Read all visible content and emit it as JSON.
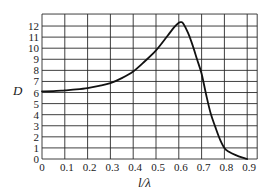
{
  "chart_data": {
    "type": "line",
    "title": "",
    "xlabel": "l/λ",
    "ylabel": "D",
    "xlim": [
      0,
      0.9
    ],
    "ylim": [
      0,
      12
    ],
    "grid": true,
    "legend": null,
    "x_ticks": [
      "0",
      "0.1",
      "0.2",
      "0.3",
      "0.4",
      "0.5",
      "0.6",
      "0.7",
      "0.8",
      "0.9"
    ],
    "y_ticks": [
      "0",
      "1",
      "2",
      "3",
      "4",
      "5",
      "6",
      "7",
      "8",
      "9",
      "10",
      "11",
      "12"
    ],
    "series": [
      {
        "name": "D",
        "x": [
          0,
          0.05,
          0.1,
          0.15,
          0.2,
          0.25,
          0.3,
          0.35,
          0.4,
          0.45,
          0.5,
          0.55,
          0.58,
          0.6,
          0.61,
          0.62,
          0.64,
          0.66,
          0.68,
          0.7,
          0.72,
          0.74,
          0.76,
          0.78,
          0.8,
          0.82,
          0.85,
          0.88,
          0.9
        ],
        "values": [
          6.1,
          6.12,
          6.2,
          6.28,
          6.4,
          6.6,
          6.85,
          7.3,
          7.9,
          8.8,
          9.8,
          11.1,
          11.9,
          12.3,
          12.35,
          12.2,
          11.4,
          10.3,
          9.0,
          7.7,
          5.8,
          4.1,
          2.9,
          1.8,
          1.0,
          0.65,
          0.35,
          0.12,
          0.0
        ]
      }
    ]
  }
}
